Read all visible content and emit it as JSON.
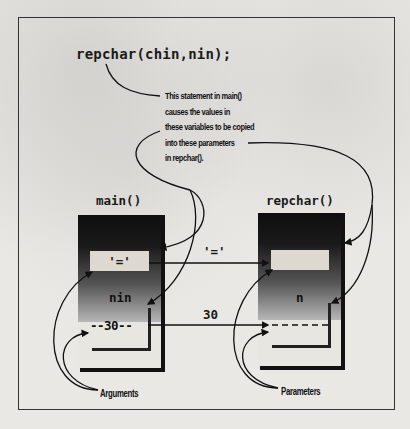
{
  "statement": "repchar(chin,nin);",
  "note_lines": [
    "This statement in main()",
    "causes the values in",
    "these variables to be copied",
    "into these parameters",
    "in repchar()."
  ],
  "caller": {
    "title": "main()",
    "char_value": "'='",
    "int_var": "nin",
    "int_value": "--30--"
  },
  "callee": {
    "title": "repchar()",
    "char_value": "",
    "int_var": "n",
    "int_value": ""
  },
  "transfers": {
    "char_label": "'='",
    "int_label": "30"
  },
  "captions": {
    "arguments": "Arguments",
    "parameters": "Parameters"
  }
}
